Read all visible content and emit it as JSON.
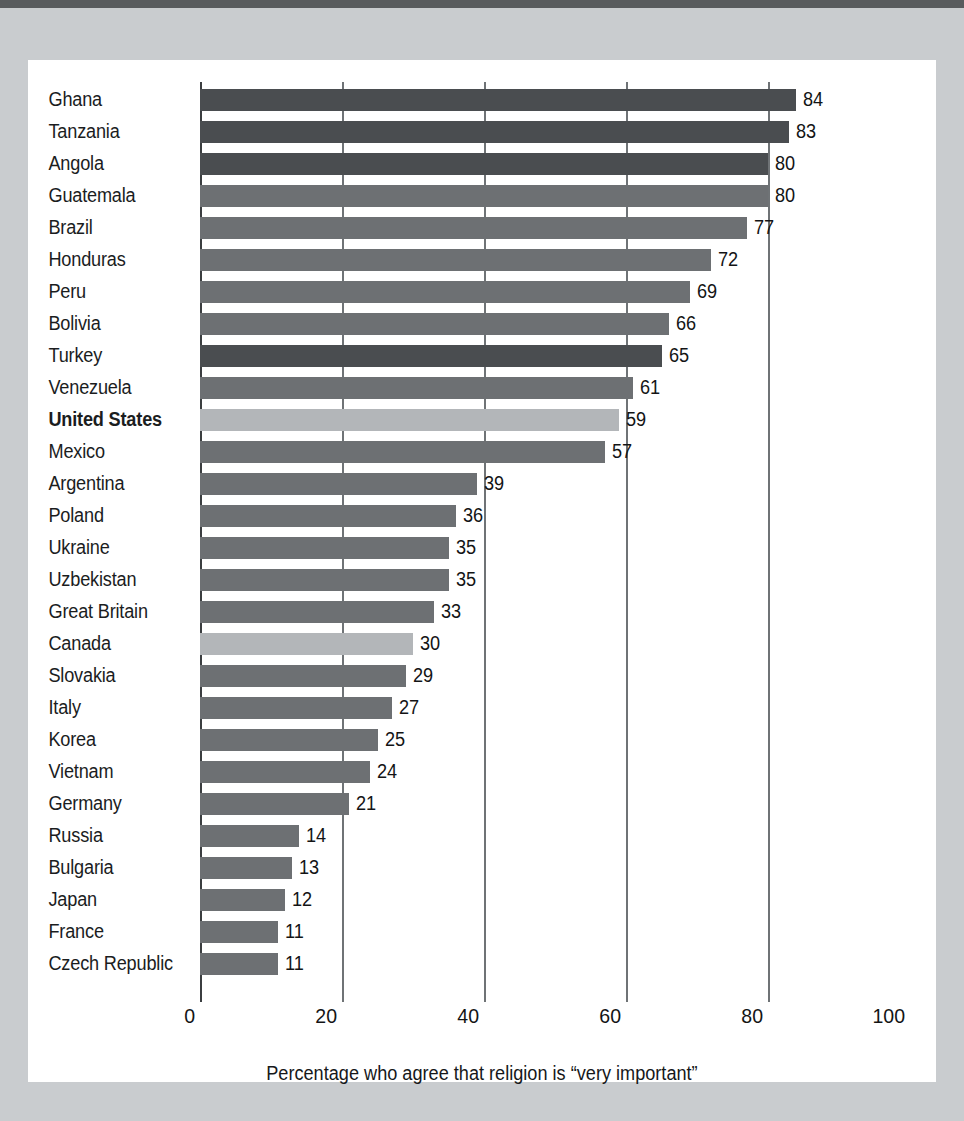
{
  "chart_data": {
    "type": "bar",
    "orientation": "horizontal",
    "title": "",
    "subtitle": "",
    "caption": "Percentage who agree that religion is “very important”",
    "xlabel": "Percentage who agree that religion is “very important”",
    "ylabel": "",
    "xlim": [
      0,
      100
    ],
    "x_ticks": [
      0,
      20,
      40,
      60,
      80,
      100
    ],
    "x_tick_labels": [
      "0",
      "20",
      "40",
      "60",
      "80",
      "100"
    ],
    "gridlines_at": [
      0,
      20,
      40,
      60,
      80
    ],
    "grid": true,
    "legend": "none",
    "categories": [
      "Ghana",
      "Tanzania",
      "Angola",
      "Guatemala",
      "Brazil",
      "Honduras",
      "Peru",
      "Bolivia",
      "Turkey",
      "Venezuela",
      "United States",
      "Mexico",
      "Argentina",
      "Poland",
      "Ukraine",
      "Uzbekistan",
      "Great Britain",
      "Canada",
      "Slovakia",
      "Italy",
      "Korea",
      "Vietnam",
      "Germany",
      "Russia",
      "Bulgaria",
      "Japan",
      "France",
      "Czech Republic"
    ],
    "values": [
      84,
      83,
      80,
      80,
      77,
      72,
      69,
      66,
      65,
      61,
      59,
      57,
      39,
      36,
      35,
      35,
      33,
      30,
      29,
      27,
      25,
      24,
      21,
      14,
      13,
      12,
      11,
      11
    ],
    "bars": [
      {
        "label": "Ghana",
        "value": 84,
        "tone": "dark",
        "highlight": false
      },
      {
        "label": "Tanzania",
        "value": 83,
        "tone": "dark",
        "highlight": false
      },
      {
        "label": "Angola",
        "value": 80,
        "tone": "dark",
        "highlight": false
      },
      {
        "label": "Guatemala",
        "value": 80,
        "tone": "mid",
        "highlight": false
      },
      {
        "label": "Brazil",
        "value": 77,
        "tone": "mid",
        "highlight": false
      },
      {
        "label": "Honduras",
        "value": 72,
        "tone": "mid",
        "highlight": false
      },
      {
        "label": "Peru",
        "value": 69,
        "tone": "mid",
        "highlight": false
      },
      {
        "label": "Bolivia",
        "value": 66,
        "tone": "mid",
        "highlight": false
      },
      {
        "label": "Turkey",
        "value": 65,
        "tone": "dark",
        "highlight": false
      },
      {
        "label": "Venezuela",
        "value": 61,
        "tone": "mid",
        "highlight": false
      },
      {
        "label": "United States",
        "value": 59,
        "tone": "light",
        "highlight": true
      },
      {
        "label": "Mexico",
        "value": 57,
        "tone": "mid",
        "highlight": false
      },
      {
        "label": "Argentina",
        "value": 39,
        "tone": "mid",
        "highlight": false
      },
      {
        "label": "Poland",
        "value": 36,
        "tone": "mid",
        "highlight": false
      },
      {
        "label": "Ukraine",
        "value": 35,
        "tone": "mid",
        "highlight": false
      },
      {
        "label": "Uzbekistan",
        "value": 35,
        "tone": "mid",
        "highlight": false
      },
      {
        "label": "Great Britain",
        "value": 33,
        "tone": "mid",
        "highlight": false
      },
      {
        "label": "Canada",
        "value": 30,
        "tone": "light",
        "highlight": false
      },
      {
        "label": "Slovakia",
        "value": 29,
        "tone": "mid",
        "highlight": false
      },
      {
        "label": "Italy",
        "value": 27,
        "tone": "mid",
        "highlight": false
      },
      {
        "label": "Korea",
        "value": 25,
        "tone": "mid",
        "highlight": false
      },
      {
        "label": "Vietnam",
        "value": 24,
        "tone": "mid",
        "highlight": false
      },
      {
        "label": "Germany",
        "value": 21,
        "tone": "mid",
        "highlight": false
      },
      {
        "label": "Russia",
        "value": 14,
        "tone": "mid",
        "highlight": false
      },
      {
        "label": "Bulgaria",
        "value": 13,
        "tone": "mid",
        "highlight": false
      },
      {
        "label": "Japan",
        "value": 12,
        "tone": "mid",
        "highlight": false
      },
      {
        "label": "France",
        "value": 11,
        "tone": "mid",
        "highlight": false
      },
      {
        "label": "Czech Republic",
        "value": 11,
        "tone": "mid",
        "highlight": false
      }
    ]
  },
  "colors": {
    "bar_dark": "#4a4d50",
    "bar_mid": "#6d7073",
    "bar_light": "#b3b6b9",
    "gridline": "#6f7376",
    "axis": "#3b3e40",
    "text": "#131415",
    "card_background": "#ffffff",
    "page_background": "#c9cccf",
    "top_band": "#585b5d"
  }
}
